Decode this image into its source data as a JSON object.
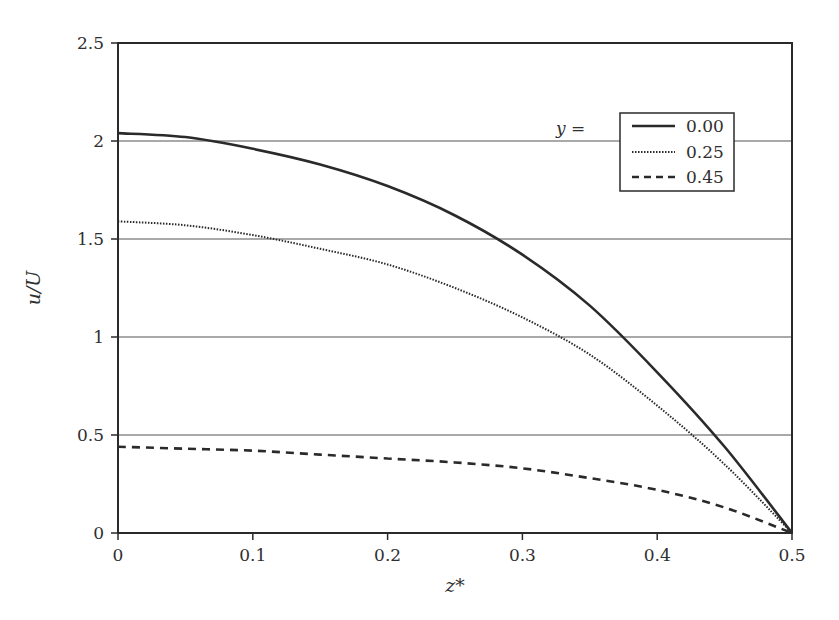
{
  "chart_data": {
    "type": "line",
    "title": "",
    "xlabel": "z*",
    "ylabel": "u/U",
    "xlim": [
      0,
      0.5
    ],
    "ylim": [
      0,
      2.5
    ],
    "x_ticks": [
      "0",
      "0.1",
      "0.2",
      "0.3",
      "0.4",
      "0.5"
    ],
    "y_ticks": [
      "0",
      "0.5",
      "1",
      "1.5",
      "2",
      "2.5"
    ],
    "grid": {
      "horizontal": true,
      "vertical": false,
      "y_values": [
        0.5,
        1.0,
        1.5,
        2.0
      ]
    },
    "legend": {
      "title": "y =",
      "position": "upper right",
      "entries": [
        "0.00",
        "0.25",
        "0.45"
      ]
    },
    "x": [
      0,
      0.05,
      0.1,
      0.15,
      0.2,
      0.25,
      0.3,
      0.35,
      0.4,
      0.45,
      0.5
    ],
    "series": [
      {
        "name": "0.00",
        "style": "solid",
        "values": [
          2.04,
          2.02,
          1.96,
          1.88,
          1.77,
          1.62,
          1.42,
          1.16,
          0.82,
          0.44,
          0.0
        ]
      },
      {
        "name": "0.25",
        "style": "dotted",
        "values": [
          1.59,
          1.57,
          1.52,
          1.45,
          1.37,
          1.25,
          1.1,
          0.91,
          0.65,
          0.35,
          0.0
        ]
      },
      {
        "name": "0.45",
        "style": "dashed",
        "values": [
          0.44,
          0.43,
          0.42,
          0.4,
          0.38,
          0.36,
          0.33,
          0.28,
          0.22,
          0.13,
          0.0
        ]
      }
    ],
    "colors": {
      "line": "#2a2a2a",
      "grid": "#555555",
      "axis": "#2a2a2a"
    }
  }
}
